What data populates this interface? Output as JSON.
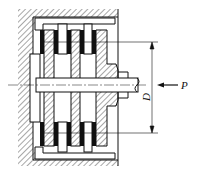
{
  "figure": {
    "type": "technical-drawing",
    "labels": {
      "force": "P",
      "diameter": "D"
    },
    "colors": {
      "line": "#111111",
      "friction_lining": "#111111",
      "background": "#ffffff"
    }
  }
}
